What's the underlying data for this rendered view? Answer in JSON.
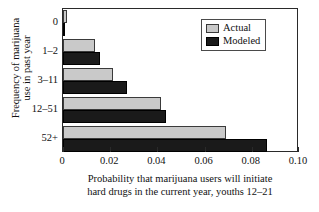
{
  "chart_data": {
    "type": "bar",
    "orientation": "horizontal",
    "title": "",
    "xlabel_lines": [
      "Probability that marijuana users will initiate",
      "hard drugs in the current year, youths 12–21"
    ],
    "ylabel_lines": [
      "Frequency of marijuana",
      "use in past year"
    ],
    "categories": [
      "0",
      "1–2",
      "3–11",
      "12–51",
      "52+"
    ],
    "series": [
      {
        "name": "Actual",
        "color": "#c9c9c9",
        "values": [
          0.0015,
          0.0136,
          0.0212,
          0.0415,
          0.069
        ]
      },
      {
        "name": "Modeled",
        "color": "#1a1a1a",
        "values": [
          0.0008,
          0.0157,
          0.0271,
          0.0437,
          0.0864
        ]
      }
    ],
    "xlim": [
      0,
      0.1
    ],
    "xticks": [
      0,
      0.02,
      0.04,
      0.06,
      0.08,
      0.1
    ],
    "xtick_labels": [
      "0",
      "0.02",
      "0.04",
      "0.06",
      "0.08",
      "0.10"
    ],
    "grid": false,
    "legend_position": "top-right",
    "legend_entries": [
      "Actual",
      "Modeled"
    ]
  }
}
